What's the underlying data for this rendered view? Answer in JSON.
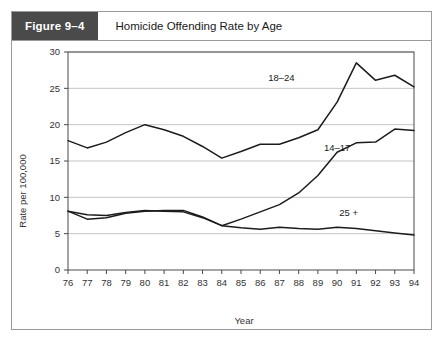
{
  "figure": {
    "badge_label": "Figure 9–4",
    "title": "Homicide Offending Rate by Age"
  },
  "chart_data": {
    "type": "line",
    "title": "Homicide Offending Rate by Age",
    "xlabel": "Year",
    "ylabel": "Rate per 100,000",
    "categories": [
      "76",
      "77",
      "78",
      "79",
      "80",
      "81",
      "82",
      "83",
      "84",
      "85",
      "86",
      "87",
      "88",
      "89",
      "90",
      "91",
      "92",
      "93",
      "94"
    ],
    "x": [
      76,
      77,
      78,
      79,
      80,
      81,
      82,
      83,
      84,
      85,
      86,
      87,
      88,
      89,
      90,
      91,
      92,
      93,
      94
    ],
    "xlim": [
      76,
      94
    ],
    "ylim": [
      0,
      30
    ],
    "yticks": [
      0,
      5,
      10,
      15,
      20,
      25,
      30
    ],
    "ytick_labels": [
      "0",
      "5",
      "10",
      "15",
      "20",
      "25",
      "30"
    ],
    "grid": true,
    "legend_position": "inline-annotations",
    "series": [
      {
        "name": "18–24",
        "label": "18–24",
        "label_x": 87.1,
        "label_y": 26.0,
        "values": [
          17.8,
          16.8,
          17.6,
          18.9,
          20.0,
          19.3,
          18.4,
          17.0,
          15.4,
          16.3,
          17.3,
          17.3,
          18.2,
          19.3,
          23.1,
          28.5,
          26.1,
          26.8,
          25.2
        ]
      },
      {
        "name": "14–17",
        "label": "14–17",
        "label_x": 90.0,
        "label_y": 16.4,
        "values": [
          8.1,
          7.0,
          7.2,
          7.8,
          8.1,
          8.2,
          8.2,
          7.3,
          6.1,
          7.0,
          8.0,
          9.0,
          10.6,
          13.0,
          16.2,
          17.5,
          17.6,
          19.4,
          19.2
        ]
      },
      {
        "name": "25 +",
        "label": "25 +",
        "label_x": 90.6,
        "label_y": 7.4,
        "values": [
          8.1,
          7.6,
          7.5,
          7.9,
          8.2,
          8.1,
          8.0,
          7.2,
          6.1,
          5.8,
          5.6,
          5.9,
          5.7,
          5.6,
          5.9,
          5.7,
          5.4,
          5.1,
          4.8
        ]
      }
    ]
  },
  "colors": {
    "badge_background": "#4a4a4a",
    "line": "#1c1c1c",
    "grid": "#bdbdbd",
    "axis": "#4a4a4a",
    "card_border": "#9a9a9a"
  }
}
